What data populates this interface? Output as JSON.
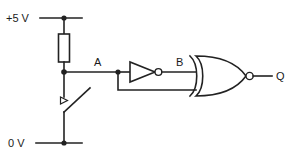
{
  "diagram": {
    "type": "schematic",
    "width": 292,
    "height": 161,
    "background_color": "#ffffff",
    "line_color": "#222222"
  },
  "labels": {
    "supply_positive": "+5 V",
    "supply_ground": "0 V",
    "node_a": "A",
    "node_b": "B",
    "output_q": "Q"
  },
  "components": [
    {
      "id": "resistor",
      "name": "pull-up-resistor",
      "symbol": "rectangular-resistor",
      "orientation": "vertical"
    },
    {
      "id": "switch",
      "name": "push-switch",
      "symbol": "spst-switch",
      "state": "open"
    },
    {
      "id": "inverter",
      "name": "not-gate",
      "symbol": "inverter-triangle-with-bubble",
      "input_label": "A",
      "output_label": "B"
    },
    {
      "id": "nor",
      "name": "nor-gate",
      "symbol": "or-shape-with-bubble",
      "inputs": [
        "B",
        "A"
      ],
      "output_label": "Q"
    }
  ],
  "nets": [
    {
      "name": "vcc-rail",
      "label": "+5 V"
    },
    {
      "name": "node-a-net",
      "label": "A"
    },
    {
      "name": "node-b-net",
      "label": "B"
    },
    {
      "name": "gnd-rail",
      "label": "0 V"
    },
    {
      "name": "output-net",
      "label": "Q"
    }
  ]
}
